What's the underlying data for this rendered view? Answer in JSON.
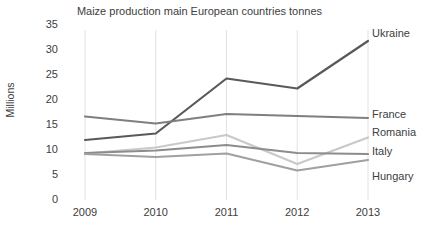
{
  "chart_data": {
    "type": "line",
    "title": "Maize production main European countries tonnes",
    "xlabel": "",
    "ylabel": "Millions",
    "categories": [
      "2009",
      "2010",
      "2011",
      "2012",
      "2013"
    ],
    "x": [
      2009,
      2010,
      2011,
      2012,
      2013
    ],
    "ylim": [
      0,
      35
    ],
    "yticks": [
      0,
      5,
      10,
      15,
      20,
      25,
      30,
      35
    ],
    "grid": "vertical",
    "legend_position": "right-inline-labels",
    "series": [
      {
        "name": "Ukraine",
        "color": "#595959",
        "values": [
          12.0,
          13.3,
          24.3,
          22.3,
          31.8
        ]
      },
      {
        "name": "France",
        "color": "#7f7f7f",
        "values": [
          16.7,
          15.3,
          17.2,
          16.8,
          16.4
        ]
      },
      {
        "name": "Romania",
        "color": "#c9c9c9",
        "values": [
          9.3,
          10.5,
          13.0,
          7.2,
          12.5
        ]
      },
      {
        "name": "Italy",
        "color": "#8c8c8c",
        "values": [
          9.4,
          9.9,
          11.0,
          9.4,
          9.2
        ]
      },
      {
        "name": "Hungary",
        "color": "#a0a0a0",
        "values": [
          9.2,
          8.6,
          9.3,
          5.9,
          8.0
        ]
      }
    ]
  },
  "labels": {
    "ukraine": "Ukraine",
    "france": "France",
    "romania": "Romania",
    "italy": "Italy",
    "hungary": "Hungary"
  },
  "colors": {
    "background": "#ffffff",
    "text": "#404040",
    "gridline": "#e2e2e2"
  }
}
